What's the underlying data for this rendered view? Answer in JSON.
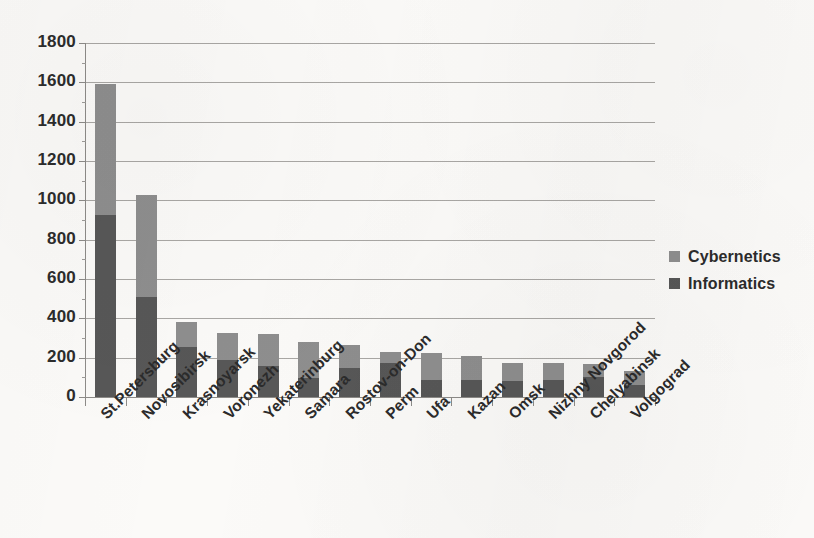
{
  "chart_data": {
    "type": "bar",
    "subtype": "stacked-vertical-bar",
    "title": "",
    "xlabel": "",
    "ylabel": "",
    "ylim": [
      0,
      1800
    ],
    "ytick_step": 200,
    "ytick_labels": [
      "1800",
      "1600",
      "1400",
      "1200",
      "1000",
      "800",
      "600",
      "400",
      "200",
      "0"
    ],
    "ytick_values": [
      1800,
      1600,
      1400,
      1200,
      1000,
      800,
      600,
      400,
      200,
      0
    ],
    "grid": true,
    "grid_axis": "y",
    "legend_position": "right",
    "categories": [
      "St.Petersburg",
      "Novosibirsk",
      "Krasnoyarsk",
      "Voronezh",
      "Yekaterinburg",
      "Samara",
      "Rostov-on-Don",
      "Perm",
      "Ufa",
      "Kazan",
      "Omsk",
      "Nizhny Novgorod",
      "Chelyabinsk",
      "Volgograd"
    ],
    "series": [
      {
        "name": "Informatics",
        "color": "#575757",
        "values": [
          925,
          508,
          254,
          188,
          160,
          97,
          147,
          172,
          88,
          88,
          83,
          88,
          104,
          60
        ]
      },
      {
        "name": "Cybernetics",
        "color": "#8e8e8e",
        "values": [
          666,
          519,
          127,
          137,
          160,
          183,
          117,
          57,
          136,
          119,
          89,
          84,
          63,
          74
        ]
      }
    ],
    "stack_totals": [
      1591,
      1027,
      381,
      325,
      320,
      280,
      264,
      229,
      224,
      207,
      172,
      172,
      167,
      134
    ],
    "stack_order_bottom_to_top": [
      "Informatics",
      "Cybernetics"
    ]
  },
  "legend": {
    "items": [
      {
        "label": "Cybernetics",
        "color": "#8e8e8e",
        "swatch_name": "legend-swatch-cybernetics"
      },
      {
        "label": "Informatics",
        "color": "#575757",
        "swatch_name": "legend-swatch-informatics"
      }
    ]
  },
  "colors": {
    "background": "#fbfaf8",
    "gridline": "#a9a7a4",
    "axis": "#8d8b88",
    "text": "#2b2b2b",
    "cybernetics": "#8e8e8e",
    "informatics": "#575757"
  }
}
